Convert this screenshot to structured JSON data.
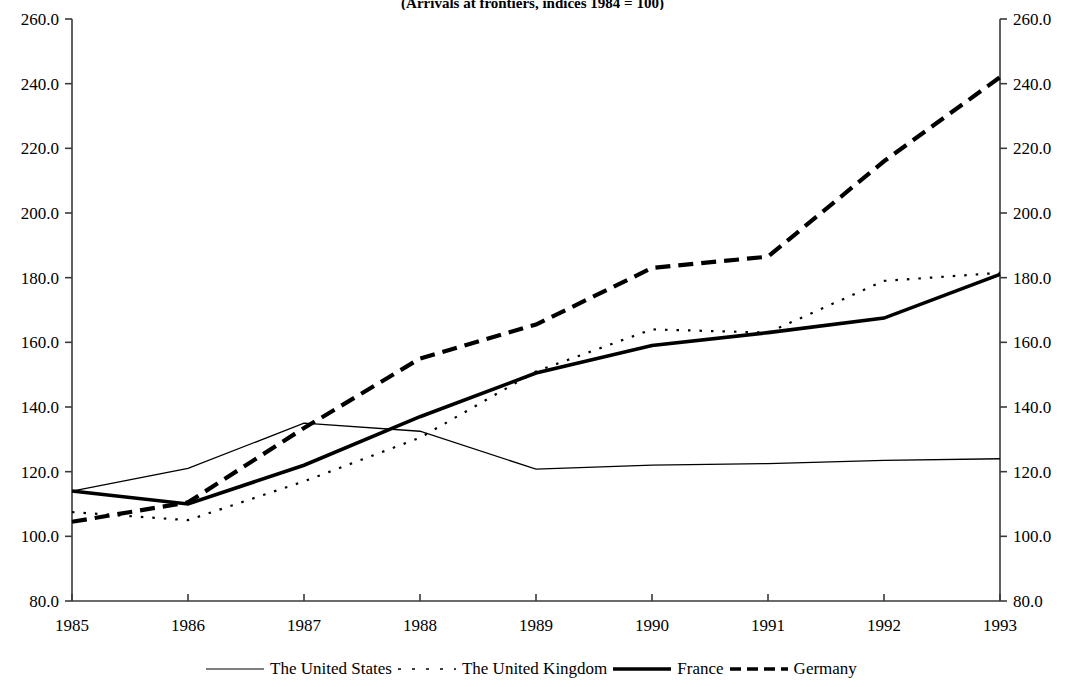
{
  "chart_data": {
    "type": "line",
    "title": "(Arrivals at frontiers, indices 1984 = 100)",
    "xlabel": "",
    "ylabel": "",
    "x": [
      1985,
      1986,
      1987,
      1988,
      1989,
      1990,
      1991,
      1992,
      1993
    ],
    "categories": [
      "1985",
      "1986",
      "1987",
      "1988",
      "1989",
      "1990",
      "1991",
      "1992",
      "1993"
    ],
    "ylim": [
      80.0,
      260.0
    ],
    "ytick_labels": [
      "80.0",
      "100.0",
      "120.0",
      "140.0",
      "160.0",
      "180.0",
      "200.0",
      "220.0",
      "240.0",
      "260.0"
    ],
    "ytick_values": [
      80.0,
      100.0,
      120.0,
      140.0,
      160.0,
      180.0,
      200.0,
      220.0,
      240.0,
      260.0
    ],
    "ytick_labels_right": [
      "80.0",
      "100.0",
      "120.0",
      "140.0",
      "160.0",
      "180.0",
      "200.0",
      "220.0",
      "240.0",
      "260.0"
    ],
    "grid": false,
    "legend_position": "bottom",
    "dual_axis": true,
    "series": [
      {
        "name": "The United States",
        "style": "thin-solid",
        "values": [
          114.0,
          121.0,
          135.0,
          132.5,
          120.8,
          122.0,
          122.5,
          123.5,
          124.0
        ]
      },
      {
        "name": "The United Kingdom",
        "style": "dotted",
        "values": [
          107.5,
          105.0,
          117.0,
          130.5,
          151.0,
          164.0,
          163.0,
          179.0,
          181.5
        ]
      },
      {
        "name": "France",
        "style": "thick-solid",
        "values": [
          114.0,
          110.0,
          122.0,
          137.0,
          150.5,
          159.0,
          163.0,
          167.5,
          181.0
        ]
      },
      {
        "name": "Germany",
        "style": "thick-dashed",
        "values": [
          104.5,
          110.5,
          133.5,
          155.0,
          165.5,
          183.0,
          186.5,
          216.0,
          242.0
        ]
      }
    ]
  },
  "legend": {
    "items": [
      {
        "label": "The United States",
        "style": "thin-solid"
      },
      {
        "label": "The United Kingdom",
        "style": "dotted"
      },
      {
        "label": "France",
        "style": "thick-solid"
      },
      {
        "label": "Germany",
        "style": "thick-dashed"
      }
    ]
  },
  "colors": {
    "line": "#000000",
    "axis": "#3a3a3a",
    "background": "#ffffff"
  }
}
